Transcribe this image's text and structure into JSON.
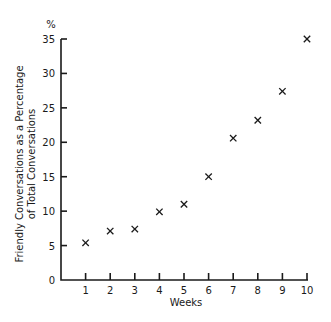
{
  "chart_data": {
    "type": "scatter",
    "title": "",
    "xlabel": "Weeks",
    "ylabel": "Friendly Conversations as a Percentage of Total Conversations",
    "ylabel_lines": [
      "Friendly Conversations as a Percentage",
      "of Total Conversations"
    ],
    "y_unit": "%",
    "marker": "x",
    "x": [
      1,
      2,
      3,
      4,
      5,
      6,
      7,
      8,
      9,
      10
    ],
    "values": [
      5.4,
      7.1,
      7.4,
      9.9,
      11.0,
      15.0,
      20.6,
      23.2,
      27.4,
      35.0
    ],
    "xlim": [
      0,
      10
    ],
    "ylim": [
      0,
      35
    ],
    "x_ticks": [
      "1",
      "2",
      "3",
      "4",
      "5",
      "6",
      "7",
      "8",
      "9",
      "10"
    ],
    "y_ticks": [
      "0",
      "5",
      "10",
      "15",
      "20",
      "25",
      "30",
      "35"
    ],
    "grid": false,
    "legend": null
  }
}
